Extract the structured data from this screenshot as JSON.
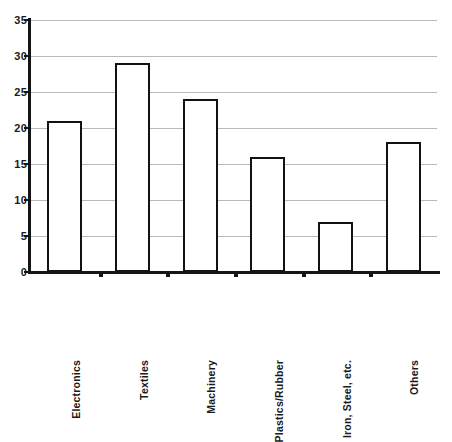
{
  "chart_data": {
    "type": "bar",
    "title": "",
    "subtitle": "",
    "xlabel": "",
    "ylabel": "",
    "categories": [
      "Electronics",
      "Textiles",
      "Machinery",
      "Plastics/Rubber",
      "Iron, Steel, etc.",
      "Others"
    ],
    "values": [
      21,
      29,
      24,
      16,
      7,
      18
    ],
    "ylim": [
      0,
      35
    ],
    "y_ticks": [
      0,
      5,
      10,
      15,
      20,
      25,
      30,
      35
    ],
    "y_tick_labels": [
      "0",
      "5",
      "10",
      "15",
      "20",
      "25",
      "30",
      "35"
    ],
    "grid": true,
    "grid_axis": "y",
    "legend": false,
    "legend_position": "none",
    "bar_fill_color": "#ffffff",
    "bar_edge_color": "#121212",
    "gridline_color": "#b9b9b9",
    "axis_color": "#151515",
    "label_rotation": 90
  }
}
